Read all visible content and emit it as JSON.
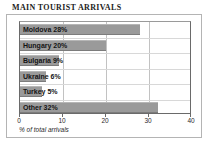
{
  "chart_data": {
    "type": "bar",
    "orientation": "horizontal",
    "title": "MAIN TOURIST ARRIVALS",
    "xlabel": "% of total arrivals",
    "ylabel": "",
    "categories": [
      "Moldova",
      "Hungary",
      "Bulgaria",
      "Ukraine",
      "Turkey",
      "Other"
    ],
    "values": [
      28,
      20,
      9,
      6,
      5,
      32
    ],
    "bar_labels": [
      "Moldova 28%",
      "Hungary 20%",
      "Bulgaria 9%",
      "Ukraine 6%",
      "Turkey 5%",
      "Other 32%"
    ],
    "xlim": [
      0,
      40
    ],
    "xticks": [
      0,
      10,
      20,
      30,
      40
    ],
    "xtick_labels": [
      "0",
      "10",
      "20",
      "30",
      "40"
    ],
    "grid": true,
    "grid_axis": "x",
    "legend": false,
    "bar_color": "#9a9a9a",
    "plot_background": "#ffffff",
    "frame_color": "#b4b4b4",
    "gridline_color": "#c2c2c2",
    "label_color": "#141414"
  }
}
